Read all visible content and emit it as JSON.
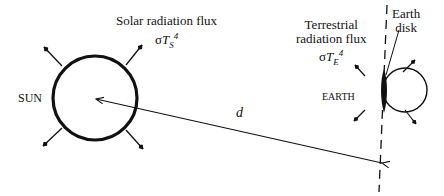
{
  "sun": {
    "label": "SUN",
    "flux_label": "Solar radiation flux",
    "flux_formula": {
      "sigma": "σ",
      "T": "T",
      "sub": "S",
      "sup": "4"
    }
  },
  "earth": {
    "label": "EARTH",
    "flux_label_line1": "Terrestrial",
    "flux_label_line2": "radiation flux",
    "flux_formula": {
      "sigma": "σ",
      "T": "T",
      "sub": "E",
      "sup": "4"
    },
    "disk_label_line1": "Earth",
    "disk_label_line2": "disk"
  },
  "distance": {
    "label": "d"
  },
  "colors": {
    "ink": "#111111",
    "background": "#ffffff"
  }
}
